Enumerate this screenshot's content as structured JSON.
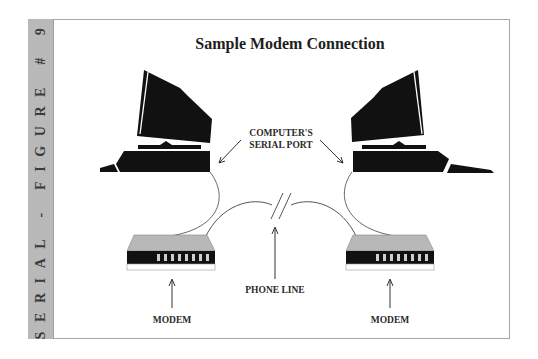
{
  "sideband": {
    "text": "SERIAL - FIGURE # 9",
    "color": "#b9b9b9"
  },
  "title": "Sample Modem Connection",
  "labels": {
    "serial_port_line1": "COMPUTER'S",
    "serial_port_line2": "SERIAL PORT",
    "phone_line": "PHONE LINE",
    "modem_left": "MODEM",
    "modem_right": "MODEM"
  },
  "components": [
    {
      "name": "left-computer",
      "type": "computer"
    },
    {
      "name": "right-computer",
      "type": "computer"
    },
    {
      "name": "left-modem",
      "type": "modem",
      "indicator_lights": 8
    },
    {
      "name": "right-modem",
      "type": "modem",
      "indicator_lights": 8
    },
    {
      "name": "phone-line",
      "type": "line",
      "break_marker": "//"
    }
  ],
  "colors": {
    "device_fill": "#111111",
    "modem_top": "#b8b8b8",
    "line": "#555555",
    "frame": "#a8a8a8"
  }
}
